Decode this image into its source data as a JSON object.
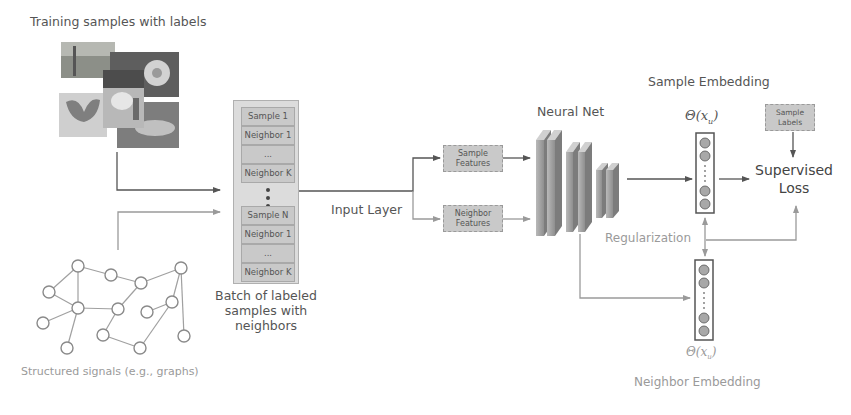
{
  "training": {
    "title": "Training samples with labels",
    "photos": [
      "bridge",
      "flower",
      "dog",
      "butterfly",
      "car"
    ]
  },
  "graph": {
    "caption": "Structured signals (e.g., graphs)",
    "nodes": [
      [
        78,
        266
      ],
      [
        111,
        275
      ],
      [
        141,
        283
      ],
      [
        181,
        268
      ],
      [
        49,
        292
      ],
      [
        78,
        308
      ],
      [
        118,
        309
      ],
      [
        172,
        302
      ],
      [
        147,
        312
      ],
      [
        43,
        323
      ],
      [
        103,
        335
      ],
      [
        184,
        336
      ],
      [
        67,
        348
      ],
      [
        140,
        348
      ]
    ]
  },
  "batch": {
    "cells_top": [
      "Sample 1",
      "Neighbor 1",
      "...",
      "Neighbor K"
    ],
    "cells_bottom": [
      "Sample N",
      "Neighbor 1",
      "...",
      "Neighbor K"
    ],
    "caption_line1": "Batch of labeled",
    "caption_line2": "samples with neighbors"
  },
  "input_layer": {
    "label": "Input Layer"
  },
  "features": {
    "sample_line1": "Sample",
    "sample_line2": "Features",
    "neighbor_line1": "Neighbor",
    "neighbor_line2": "Features"
  },
  "neural_net": {
    "label": "Neural Net"
  },
  "sample_embedding": {
    "title": "Sample Embedding",
    "symbol": "Θ(x",
    "subscript": "u",
    "symbol_close": ")"
  },
  "neighbor_embedding": {
    "title": "Neighbor Embedding",
    "symbol": "Θ(x",
    "subscript": "u",
    "symbol_close": ")"
  },
  "sample_labels": {
    "line1": "Sample",
    "line2": "Labels"
  },
  "loss": {
    "line1": "Supervised",
    "line2": "Loss"
  },
  "regularization": {
    "label": "Regularization"
  },
  "colors": {
    "line_dark": "#555555",
    "line_light": "#9a9a9a",
    "box_fill": "#c9c9c9",
    "node_fill": "#a8a8a8"
  }
}
